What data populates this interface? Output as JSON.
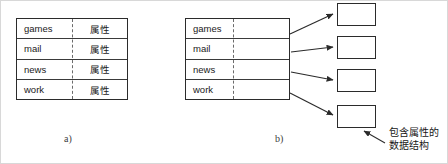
{
  "figure": {
    "title_a_caption": "a)",
    "title_b_caption": "b)",
    "annotation": {
      "line1": "包含属性的",
      "line2": "数据结构"
    }
  },
  "table_a": {
    "rows": [
      {
        "key": "games",
        "value": "属性"
      },
      {
        "key": "mail",
        "value": "属性"
      },
      {
        "key": "news",
        "value": "属性"
      },
      {
        "key": "work",
        "value": "属性"
      }
    ]
  },
  "table_b": {
    "rows": [
      {
        "key": "games",
        "value": ""
      },
      {
        "key": "mail",
        "value": ""
      },
      {
        "key": "news",
        "value": ""
      },
      {
        "key": "work",
        "value": ""
      }
    ],
    "boxes": [
      {
        "label": ""
      },
      {
        "label": ""
      },
      {
        "label": ""
      },
      {
        "label": ""
      }
    ]
  },
  "colors": {
    "ink": "#2b2b2b",
    "rule": "#3a3a3a",
    "dash": "#6b6b6b",
    "paper": "#ffffff",
    "frame": "#d8d8d8"
  }
}
